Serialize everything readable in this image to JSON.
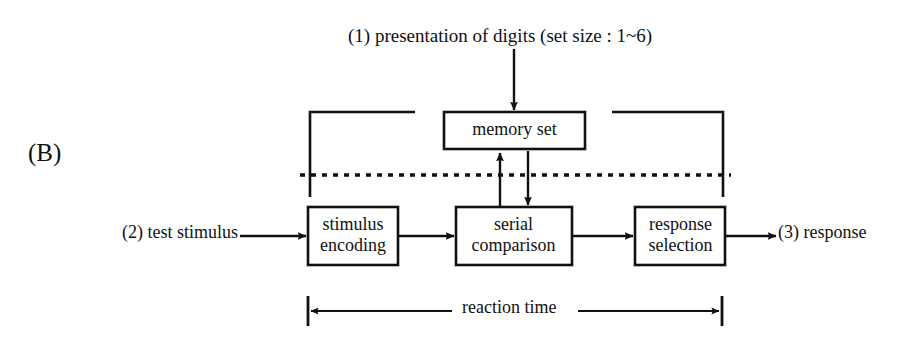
{
  "figure": {
    "panel_label": "(B)",
    "type": "flow-diagram",
    "title_note": "(1) presentation of digits (set size : 1~6)",
    "input_note": "(2) test stimulus",
    "output_note": "(3) response",
    "span_label": "reaction time",
    "stroke_color": "#111111",
    "background_color": "#ffffff"
  },
  "nodes": {
    "memory_set": "memory set",
    "stimulus_encoding_line1": "stimulus",
    "stimulus_encoding_line2": "encoding",
    "serial_comparison_line1": "serial",
    "serial_comparison_line2": "comparison",
    "response_selection_line1": "response",
    "response_selection_line2": "selection"
  }
}
